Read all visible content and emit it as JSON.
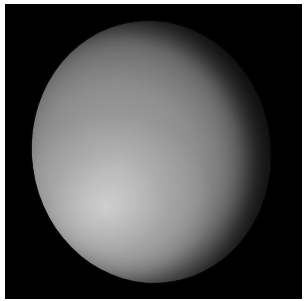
{
  "image": {
    "subject": "planet disk",
    "description": "Grayscale image of a planet (phase partially lit) on black background",
    "colors": {
      "background": "#000000",
      "border": "#ffffff",
      "bright_region": "#c8c8c8",
      "mid_tone": "#8e8e8e",
      "terminator": "#111111"
    }
  }
}
